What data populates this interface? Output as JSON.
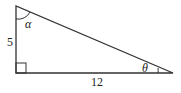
{
  "diagram": {
    "type": "right-triangle",
    "side_vertical_label": "5",
    "side_horizontal_label": "12",
    "angle_top_label": "α",
    "angle_right_label": "θ",
    "right_angle_marker": true,
    "stroke_color": "#333333"
  }
}
